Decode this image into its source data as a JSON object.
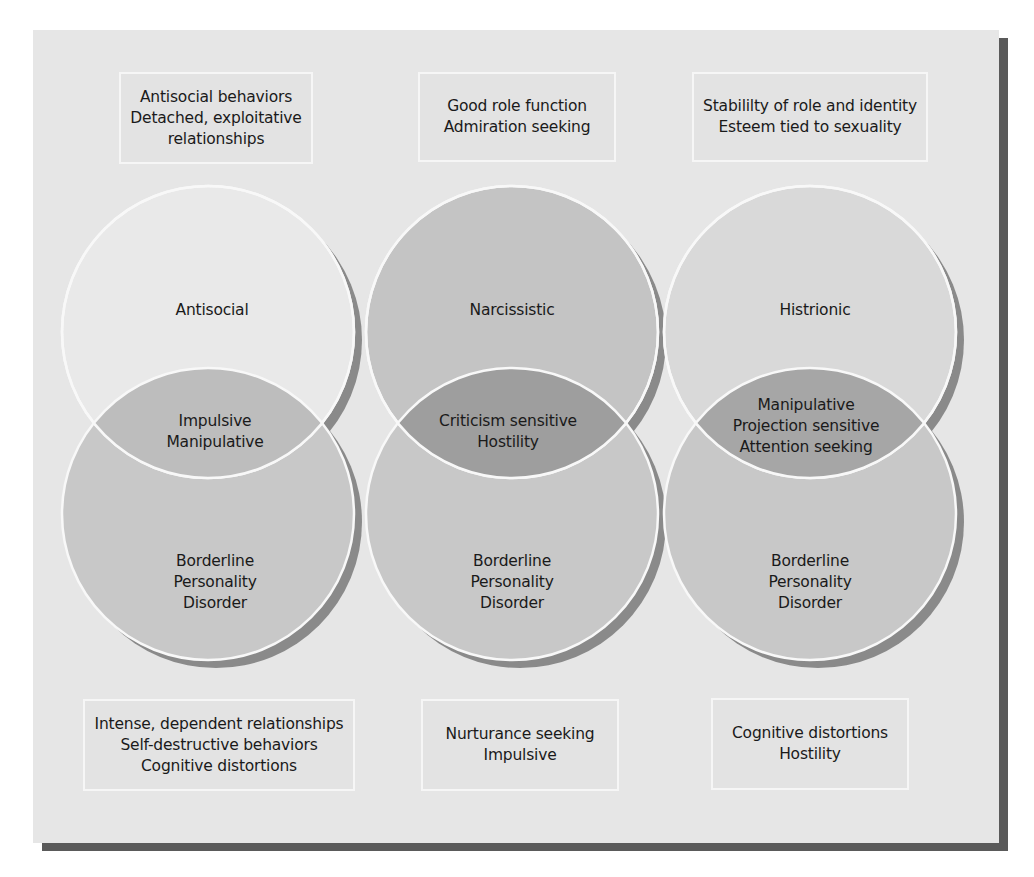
{
  "top_boxes": [
    {
      "lines": [
        "Antisocial behaviors",
        "Detached, exploitative",
        "relationships"
      ]
    },
    {
      "lines": [
        "Good role function",
        "Admiration seeking"
      ]
    },
    {
      "lines": [
        "Stabililty of role and identity",
        "Esteem tied to sexuality"
      ]
    }
  ],
  "circles_top": [
    {
      "label": "Antisocial"
    },
    {
      "label": "Narcissistic"
    },
    {
      "label": "Histrionic"
    }
  ],
  "overlaps": [
    {
      "lines": [
        "Impulsive",
        "Manipulative"
      ]
    },
    {
      "lines": [
        "Criticism sensitive",
        "Hostility"
      ]
    },
    {
      "lines": [
        "Manipulative",
        "Projection sensitive",
        "Attention seeking"
      ]
    }
  ],
  "circles_bottom": [
    {
      "lines": [
        "Borderline",
        "Personality",
        "Disorder"
      ]
    },
    {
      "lines": [
        "Borderline",
        "Personality",
        "Disorder"
      ]
    },
    {
      "lines": [
        "Borderline",
        "Personality",
        "Disorder"
      ]
    }
  ],
  "bottom_boxes": [
    {
      "lines": [
        "Intense, dependent relationships",
        "Self-destructive behaviors",
        "Cognitive distortions"
      ]
    },
    {
      "lines": [
        "Nurturance seeking",
        "Impulsive"
      ]
    },
    {
      "lines": [
        "Cognitive distortions",
        "Hostility"
      ]
    }
  ],
  "colors": {
    "panel": "#e6e6e6",
    "shadow": "#5a5a5a",
    "antisocial_fill": "#e9e9e9",
    "narcissistic_fill": "#c4c4c4",
    "histrionic_fill": "#d9d9d9",
    "borderline_fill": "#c8c8c8",
    "overlap_light": "#b8b8b8",
    "overlap_dark": "#9e9e9e"
  }
}
